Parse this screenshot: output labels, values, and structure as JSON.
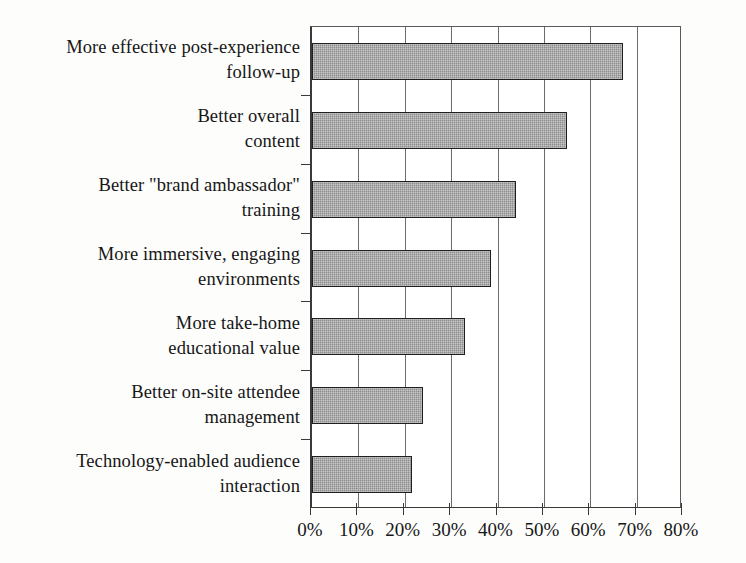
{
  "chart_data": {
    "type": "bar",
    "orientation": "horizontal",
    "title": "",
    "subtitle": "",
    "xlabel": "",
    "ylabel": "",
    "categories": [
      "More effective post-experience follow-up",
      "Better overall content",
      "Better \"brand ambassador\" training",
      "More immersive, engaging environments",
      "More take-home educational value",
      "Better on-site attendee management",
      "Technology-enabled audience interaction"
    ],
    "category_lines": [
      [
        "More effective post-experience",
        "follow-up"
      ],
      [
        "Better overall",
        "content"
      ],
      [
        "Better \"brand ambassador\"",
        "training"
      ],
      [
        "More immersive, engaging",
        "environments"
      ],
      [
        "More take-home",
        "educational value"
      ],
      [
        "Better on-site attendee",
        "management"
      ],
      [
        "Technology-enabled audience",
        "interaction"
      ]
    ],
    "values": [
      67,
      55,
      44,
      38.5,
      33,
      24,
      21.5
    ],
    "value_labels": [
      "67%",
      "55%",
      "44%",
      "38.5%",
      "33%",
      "24%",
      "21.5%"
    ],
    "xlim": [
      0,
      80
    ],
    "xticks": [
      0,
      10,
      20,
      30,
      40,
      50,
      60,
      70,
      80
    ],
    "xtick_labels": [
      "0%",
      "10%",
      "20%",
      "30%",
      "40%",
      "50%",
      "60%",
      "70%",
      "80%"
    ],
    "grid": "vertical",
    "legend": "none",
    "bar_fill_color": "#8d8d8d",
    "bar_border_color": "#1f1f1f",
    "axis_color": "#3a3a3a",
    "gridline_color": "#6b6b6b",
    "background_color": "#ffffff"
  }
}
